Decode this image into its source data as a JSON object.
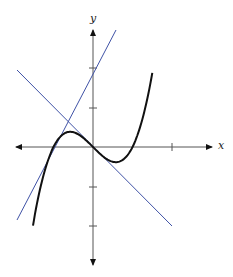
{
  "figure": {
    "x_label": "x",
    "y_label": "y",
    "origin_px": [
      93,
      147
    ],
    "unit_px": 39.5,
    "x_ticks": [
      2
    ],
    "y_ticks": [
      -2,
      -1,
      1,
      2
    ],
    "colors": {
      "curve": "#111111",
      "tangent": "#3f52a6",
      "axis": "#555555"
    }
  },
  "chart_data": {
    "type": "line",
    "title": "",
    "xlabel": "x",
    "ylabel": "y",
    "xlim": [
      -2,
      3
    ],
    "ylim": [
      -3,
      3
    ],
    "grid": false,
    "series": [
      {
        "name": "curve y = x^3 - x",
        "x_range": [
          -1.52,
          1.5
        ]
      },
      {
        "name": "tangent at x=0: y = -x",
        "x_range": [
          -1.93,
          2.0
        ]
      },
      {
        "name": "tangent at x=-1: y = 2x + 2",
        "x_range": [
          -1.93,
          0.58
        ]
      }
    ]
  }
}
